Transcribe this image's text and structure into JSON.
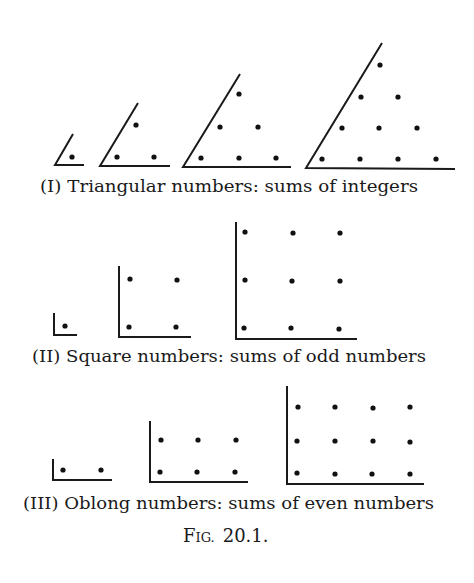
{
  "figure": {
    "label_prefix_big": "F",
    "label_prefix_small": "IG.",
    "label_number": "20.1.",
    "colors": {
      "ink": "#1a1a1a",
      "background": "#ffffff"
    }
  },
  "panels": [
    {
      "id": "triangular",
      "caption": "(I) Triangular numbers: sums of integers",
      "shape": "triangle",
      "figures": [
        {
          "n": 1,
          "dot_count": 1,
          "rows": [
            1
          ]
        },
        {
          "n": 2,
          "dot_count": 3,
          "rows": [
            2,
            1
          ]
        },
        {
          "n": 3,
          "dot_count": 6,
          "rows": [
            3,
            2,
            1
          ]
        },
        {
          "n": 4,
          "dot_count": 10,
          "rows": [
            4,
            3,
            2,
            1
          ]
        }
      ]
    },
    {
      "id": "square",
      "caption": "(II) Square numbers: sums of odd numbers",
      "shape": "square",
      "figures": [
        {
          "n": 1,
          "dot_count": 1,
          "grid": "1x1"
        },
        {
          "n": 2,
          "dot_count": 4,
          "grid": "2x2"
        },
        {
          "n": 3,
          "dot_count": 9,
          "grid": "3x3"
        }
      ]
    },
    {
      "id": "oblong",
      "caption": "(III) Oblong numbers: sums of even numbers",
      "shape": "oblong",
      "figures": [
        {
          "n": 1,
          "dot_count": 2,
          "grid": "1x2"
        },
        {
          "n": 2,
          "dot_count": 6,
          "grid": "2x3"
        },
        {
          "n": 3,
          "dot_count": 12,
          "grid": "3x4"
        }
      ]
    }
  ]
}
